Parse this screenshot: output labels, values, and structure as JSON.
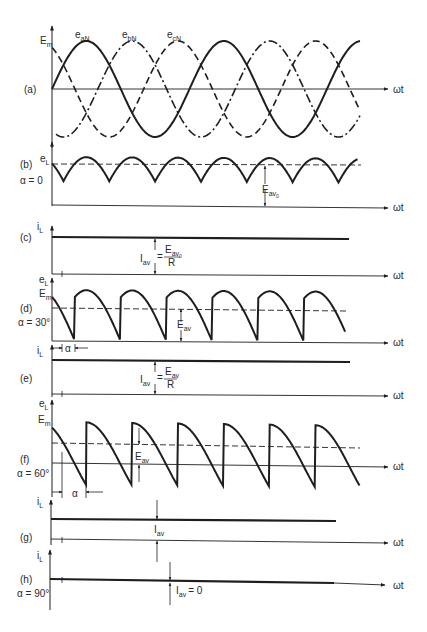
{
  "colors": {
    "ink": "#1e1e1e",
    "paper": "#ffffff",
    "label": "#2a2a2a"
  },
  "axis_label": "ωt",
  "panels": {
    "a": {
      "tag": "(a)",
      "ylabel": "E",
      "ylabel_sub": "m",
      "series": [
        {
          "name": "e",
          "sub": "aN",
          "style": "solid"
        },
        {
          "name": "e",
          "sub": "bN",
          "style": "dash-dot"
        },
        {
          "name": "e",
          "sub": "cN",
          "style": "dashed"
        }
      ]
    },
    "b": {
      "tag": "(b)",
      "alpha": "α = 0",
      "ylabel": "e",
      "ylabel_sub": "L",
      "avg": "E",
      "avg_sub": "av",
      "avg_subsub": "0"
    },
    "c": {
      "tag": "(c)",
      "ylabel": "i",
      "ylabel_sub": "L",
      "iav": "I",
      "iav_sub": "av",
      "eq": "=",
      "num": "E",
      "num_sub": "av",
      "num_subsub": "0",
      "den": "R"
    },
    "d": {
      "tag": "(d)",
      "alpha": "α = 30°",
      "ylabel": "e",
      "ylabel_sub": "L",
      "em": "E",
      "em_sub": "m",
      "avg": "E",
      "avg_sub": "av",
      "alpha_mark": "α"
    },
    "e": {
      "tag": "(e)",
      "ylabel": "i",
      "ylabel_sub": "L",
      "iav": "I",
      "iav_sub": "av",
      "eq": "=",
      "num": "E",
      "num_sub": "av",
      "den": "R"
    },
    "f": {
      "tag": "(f)",
      "alpha": "α = 60°",
      "ylabel": "e",
      "ylabel_sub": "L",
      "em": "E",
      "em_sub": "m",
      "avg": "E",
      "avg_sub": "av",
      "alpha_mark": "α"
    },
    "g": {
      "tag": "(g)",
      "ylabel": "i",
      "ylabel_sub": "L",
      "iav": "I",
      "iav_sub": "av"
    },
    "h": {
      "tag": "(h)",
      "alpha": "α = 90°",
      "ylabel": "i",
      "ylabel_sub": "L",
      "iav": "I",
      "iav_sub": "av",
      "eq_zero": "= 0"
    }
  }
}
